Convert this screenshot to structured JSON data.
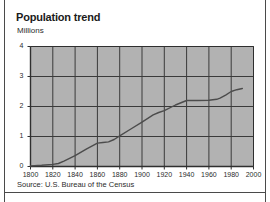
{
  "figure": {
    "title": "Population trend",
    "source": "Source: U.S. Bureau of the Census",
    "background_color": "#ffffff",
    "frame_color": "#4a4a4a"
  },
  "chart_data": {
    "type": "line",
    "title": "Population trend",
    "subtitle": "",
    "xlabel": "",
    "ylabel": "Millions",
    "xlim": [
      1800,
      2000
    ],
    "ylim": [
      0,
      4
    ],
    "xticks": [
      1800,
      1820,
      1840,
      1860,
      1880,
      1900,
      1920,
      1940,
      1960,
      1980,
      2000
    ],
    "xtick_labels": [
      "1800",
      "1820",
      "1840",
      "1860",
      "1880",
      "1900",
      "1920",
      "1940",
      "1960",
      "1980",
      "2000"
    ],
    "yticks": [
      0,
      1,
      2,
      3,
      4
    ],
    "ytick_labels": [
      "0",
      "1",
      "2",
      "3",
      "4"
    ],
    "grid": true,
    "grid_color": "#3a3a3a",
    "plot_background": "#b2b2b2",
    "legend": false,
    "legend_position": "none",
    "series": [
      {
        "name": "Population",
        "units": "Millions",
        "color": "#4c4c4c",
        "x": [
          1800,
          1810,
          1820,
          1825,
          1830,
          1840,
          1850,
          1860,
          1865,
          1870,
          1875,
          1880,
          1890,
          1900,
          1910,
          1915,
          1920,
          1930,
          1940,
          1950,
          1960,
          1967,
          1970,
          1975,
          1980,
          1985,
          1990
        ],
        "values": [
          0.02,
          0.04,
          0.07,
          0.1,
          0.18,
          0.36,
          0.58,
          0.78,
          0.8,
          0.82,
          0.9,
          1.02,
          1.25,
          1.48,
          1.72,
          1.8,
          1.86,
          2.05,
          2.2,
          2.2,
          2.21,
          2.24,
          2.28,
          2.38,
          2.5,
          2.56,
          2.6
        ]
      }
    ]
  }
}
